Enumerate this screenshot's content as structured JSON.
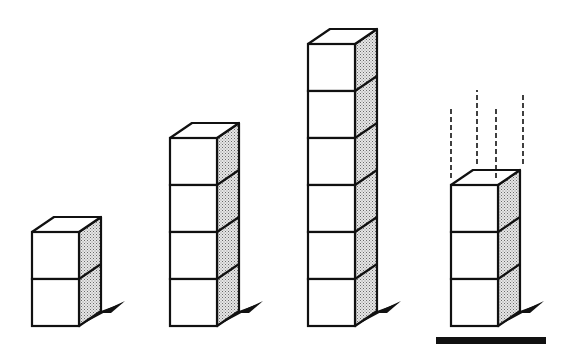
{
  "figure": {
    "cube_size": 47,
    "depth_dx": 22,
    "depth_dy": -15,
    "ground_y": 326,
    "colors": {
      "stroke": "#111111",
      "front": "#ffffff",
      "top": "#ffffff",
      "side": "#bdbdbd",
      "shadow": "#111111",
      "base_bar": "#111111"
    },
    "stacks": [
      {
        "id": "stack-1",
        "x": 32,
        "cubes": 2,
        "dashed": false,
        "base_bar": false
      },
      {
        "id": "stack-2",
        "x": 170,
        "cubes": 4,
        "dashed": false,
        "base_bar": false
      },
      {
        "id": "stack-3",
        "x": 308,
        "cubes": 6,
        "dashed": false,
        "base_bar": false
      },
      {
        "id": "stack-4",
        "x": 451,
        "cubes": 3,
        "dashed": true,
        "base_bar": true,
        "dashed_lines": [
          {
            "x": 451,
            "y1": 178,
            "y2": 108
          },
          {
            "x": 477,
            "y1": 164,
            "y2": 90
          },
          {
            "x": 496,
            "y1": 178,
            "y2": 108
          },
          {
            "x": 523,
            "y1": 164,
            "y2": 92
          }
        ],
        "bar": {
          "x1": 436,
          "x2": 546,
          "y": 337,
          "h": 7
        }
      }
    ]
  }
}
